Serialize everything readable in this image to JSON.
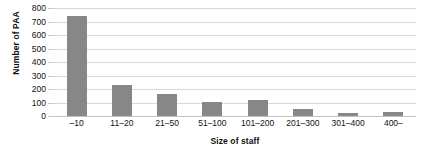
{
  "chart_data": {
    "type": "bar",
    "title": "",
    "xlabel": "Size of staff",
    "ylabel": "Number of PAA",
    "categories": [
      "–10",
      "11–20",
      "21–50",
      "51–100",
      "101–200",
      "201–300",
      "301–400",
      "400–"
    ],
    "values": [
      740,
      230,
      160,
      105,
      120,
      50,
      20,
      30
    ],
    "ylim": [
      0,
      800
    ],
    "yticks": [
      0,
      100,
      200,
      300,
      400,
      500,
      600,
      700,
      800
    ],
    "ytick_labels": [
      "0",
      "100",
      "200",
      "300",
      "400",
      "500",
      "600",
      "700",
      "800"
    ],
    "grid": true,
    "legend": false,
    "bar_color": "#878787",
    "gridline_color": "#d8d8d8",
    "background_color": "#ffffff"
  }
}
